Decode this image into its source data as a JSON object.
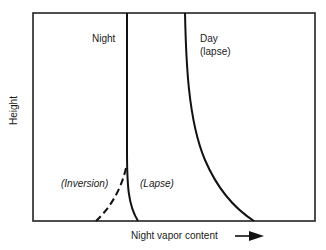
{
  "diagram": {
    "y_axis_label": "Height",
    "x_axis_label": "Night vapor content",
    "curves": {
      "night": {
        "label": "Night"
      },
      "day": {
        "label_line1": "Day",
        "label_line2": "(lapse)"
      }
    },
    "regions": {
      "inversion": "(Inversion)",
      "lapse": "(Lapse)"
    },
    "colors": {
      "line": "#1a1a1a",
      "background": "#ffffff"
    }
  }
}
